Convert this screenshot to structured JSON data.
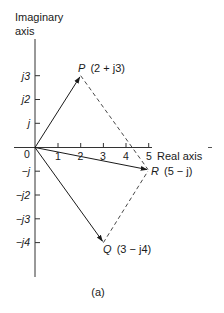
{
  "figure": {
    "caption": "(a)",
    "colors": {
      "ink": "#1a1a1a",
      "background": "#ffffff"
    }
  },
  "axes": {
    "imaginary_label_line1": "Imaginary",
    "imaginary_label_line2": "axis",
    "real_label": "Real axis",
    "origin_label": "0",
    "real_ticks": [
      "1",
      "2",
      "3",
      "4",
      "5"
    ],
    "imaginary_ticks": [
      "j3",
      "j2",
      "j",
      "−j",
      "−j2",
      "−j3",
      "−j4"
    ]
  },
  "phasors": [
    {
      "name": "P",
      "label": "P",
      "value": "(2 + j3)",
      "re": 2,
      "im": 3,
      "style": "solid-arrow"
    },
    {
      "name": "Q",
      "label": "Q",
      "value": "(3 − j4)",
      "re": 3,
      "im": -4,
      "style": "solid-arrow"
    },
    {
      "name": "R",
      "label": "R",
      "value": "(5 − j)",
      "re": 5,
      "im": -1,
      "style": "solid-arrow"
    }
  ],
  "construction_lines": [
    {
      "from": "P",
      "to": "R",
      "style": "dashed"
    },
    {
      "from": "Q",
      "to": "R",
      "style": "dashed"
    }
  ]
}
